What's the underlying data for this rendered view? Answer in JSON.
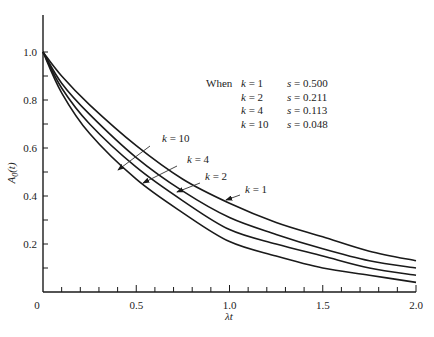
{
  "chart_data": {
    "type": "line",
    "title": "",
    "xlabel": "λt",
    "ylabel": "A0(t)",
    "xlim": [
      0,
      2.0
    ],
    "ylim": [
      0,
      1.15
    ],
    "grid": false,
    "x_ticks": [
      {
        "value": 0,
        "label": "0"
      },
      {
        "value": 0.5,
        "label": "0.5"
      },
      {
        "value": 1.0,
        "label": "1.0"
      },
      {
        "value": 1.5,
        "label": "1.5"
      },
      {
        "value": 2.0,
        "label": "2.0"
      }
    ],
    "y_ticks": [
      {
        "value": 0.2,
        "label": "0.2"
      },
      {
        "value": 0.4,
        "label": "0.4"
      },
      {
        "value": 0.6,
        "label": "0.6"
      },
      {
        "value": 0.8,
        "label": "0.8"
      },
      {
        "value": 1.0,
        "label": "1.0"
      }
    ],
    "x_minor_step": 0.1,
    "y_minor_step": 0.1,
    "x": [
      0,
      0.1,
      0.25,
      0.5,
      0.75,
      1.0,
      1.25,
      1.5,
      1.75,
      2.0
    ],
    "series": [
      {
        "name": "k = 1",
        "values": [
          1.0,
          0.9,
          0.78,
          0.61,
          0.47,
          0.37,
          0.29,
          0.23,
          0.17,
          0.13
        ]
      },
      {
        "name": "k = 2",
        "values": [
          1.0,
          0.87,
          0.74,
          0.56,
          0.42,
          0.31,
          0.24,
          0.18,
          0.13,
          0.1
        ]
      },
      {
        "name": "k = 4",
        "values": [
          1.0,
          0.85,
          0.7,
          0.52,
          0.38,
          0.26,
          0.2,
          0.15,
          0.1,
          0.07
        ]
      },
      {
        "name": "k = 10",
        "values": [
          1.0,
          0.83,
          0.66,
          0.47,
          0.33,
          0.21,
          0.15,
          0.1,
          0.07,
          0.04
        ]
      }
    ],
    "legend": {
      "position": "upper-right",
      "prefix": "When",
      "rows": [
        {
          "k": "k = 1",
          "s": "s = 0.500"
        },
        {
          "k": "k = 2",
          "s": "s = 0.211"
        },
        {
          "k": "k = 4",
          "s": "s = 0.113"
        },
        {
          "k": "k = 10",
          "s": "s = 0.048"
        }
      ]
    },
    "annotations": [
      {
        "text": "k = 10",
        "series": "k = 10"
      },
      {
        "text": "k = 4",
        "series": "k = 4"
      },
      {
        "text": "k = 2",
        "series": "k = 2"
      },
      {
        "text": "k = 1",
        "series": "k = 1"
      }
    ]
  }
}
